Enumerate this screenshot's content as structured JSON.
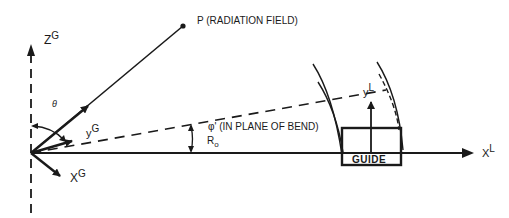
{
  "diagram": {
    "point_label": "P (RADIATION FIELD)",
    "angle_theta": "θ",
    "angle_phi": "φ' (IN PLANE OF BEND)",
    "radius_label": "R",
    "radius_sub": "o",
    "guide_label": "GUIDE",
    "axes": {
      "zG": {
        "base": "Z",
        "sup": "G"
      },
      "yG": {
        "base": "y",
        "sup": "G"
      },
      "xG": {
        "base": "X",
        "sup": "G"
      },
      "yL": {
        "base": "y",
        "sup": "L"
      },
      "xL": {
        "base": "X",
        "sup": "L"
      }
    },
    "colors": {
      "ink": "#1a1a1a",
      "background": "#ffffff"
    }
  }
}
